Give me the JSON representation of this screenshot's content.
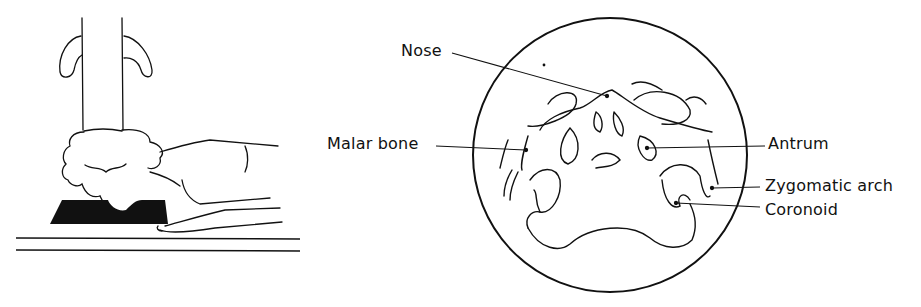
{
  "figure": {
    "left_panel": {
      "description": "Patient prone with chin on dark block beneath vertical x-ray tube"
    },
    "right_panel": {
      "description": "Circular radiograph view of facial bones",
      "labels": [
        {
          "id": "nose",
          "text": "Nose"
        },
        {
          "id": "malar",
          "text": "Malar bone"
        },
        {
          "id": "antrum",
          "text": "Antrum"
        },
        {
          "id": "zygomatic",
          "text": "Zygomatic arch"
        },
        {
          "id": "coronoid",
          "text": "Coronoid"
        }
      ]
    }
  }
}
